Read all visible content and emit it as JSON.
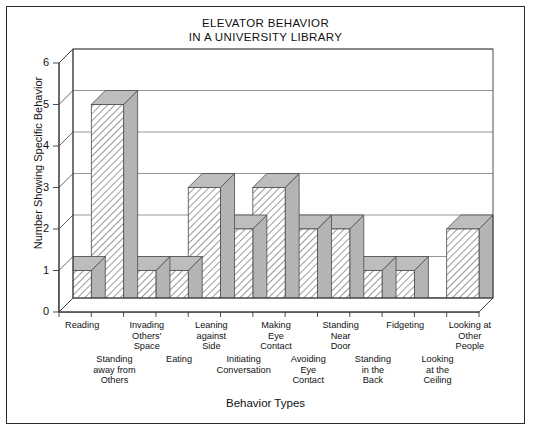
{
  "chart_data": {
    "type": "bar",
    "title": "ELEVATOR BEHAVIOR IN A UNIVERSITY LIBRARY",
    "title_line1": "ELEVATOR BEHAVIOR",
    "title_line2": "IN A UNIVERSITY LIBRARY",
    "xlabel": "Behavior Types",
    "ylabel": "Number Showing Specific Behavior",
    "ylim": [
      0,
      6
    ],
    "yticks": [
      0,
      1,
      2,
      3,
      4,
      5,
      6
    ],
    "ytick_labels": [
      "0",
      "1",
      "2",
      "3",
      "4",
      "5",
      "6"
    ],
    "grid": true,
    "legend": "none",
    "style": "3d-bar-hatched",
    "categories": [
      "Reading",
      "Standing away from Others",
      "Invading Others' Space",
      "Eating",
      "Leaning against Side",
      "Initiating Conversation",
      "Making Eye Contact",
      "Avoiding Eye Contact",
      "Standing Near Door",
      "Standing in the Back",
      "Fidgeting",
      "Looking at the Ceiling",
      "Looking at Other People"
    ],
    "values": [
      1,
      5,
      1,
      1,
      3,
      2,
      3,
      2,
      2,
      1,
      1,
      0,
      2
    ],
    "tick_labels_row_top": [
      {
        "index": 0,
        "text": "Reading"
      },
      {
        "index": 2,
        "text": "Invading\nOthers'\nSpace"
      },
      {
        "index": 4,
        "text": "Leaning\nagainst\nSide"
      },
      {
        "index": 6,
        "text": "Making\nEye\nContact"
      },
      {
        "index": 8,
        "text": "Standing\nNear\nDoor"
      },
      {
        "index": 10,
        "text": "Fidgeting"
      },
      {
        "index": 12,
        "text": "Looking at\nOther\nPeople"
      }
    ],
    "tick_labels_row_bottom": [
      {
        "index": 1,
        "text": "Standing\naway from\nOthers"
      },
      {
        "index": 3,
        "text": "Eating"
      },
      {
        "index": 5,
        "text": "Initiating\nConversation"
      },
      {
        "index": 7,
        "text": "Avoiding\nEye\nContact"
      },
      {
        "index": 9,
        "text": "Standing\nin the\nBack"
      },
      {
        "index": 11,
        "text": "Looking\nat the\nCeiling"
      }
    ]
  },
  "colors": {
    "frame": "#2b2b2b",
    "axis": "#3a3a3a",
    "grid": "#8a8a8a",
    "bar_front": "#ffffff",
    "bar_hatch": "#6f6f6f",
    "bar_top": "#bdbdbd",
    "bar_side": "#b4b4b4",
    "text": "#111111",
    "background": "#ffffff"
  }
}
